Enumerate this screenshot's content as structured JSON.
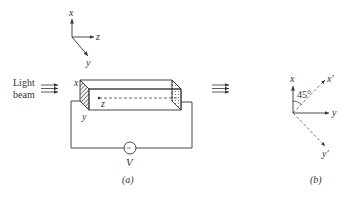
{
  "figure": {
    "axes_top": {
      "x": "x",
      "y": "y",
      "z": "z"
    },
    "light_beam": {
      "line1": "Light",
      "line2": "beam"
    },
    "crystal": {
      "face_x": "x",
      "face_y": "y",
      "axis_z": "z"
    },
    "circuit": {
      "source_symbol": "~",
      "source_label": "V"
    },
    "panel_a_caption": "(a)",
    "panel_b": {
      "x": "x",
      "y": "y",
      "x_prime": "x′",
      "y_prime": "y′",
      "angle": "45°"
    },
    "panel_b_caption": "(b)"
  },
  "colors": {
    "line": "#333333",
    "hatch": "#555555",
    "background": "#ffffff"
  }
}
